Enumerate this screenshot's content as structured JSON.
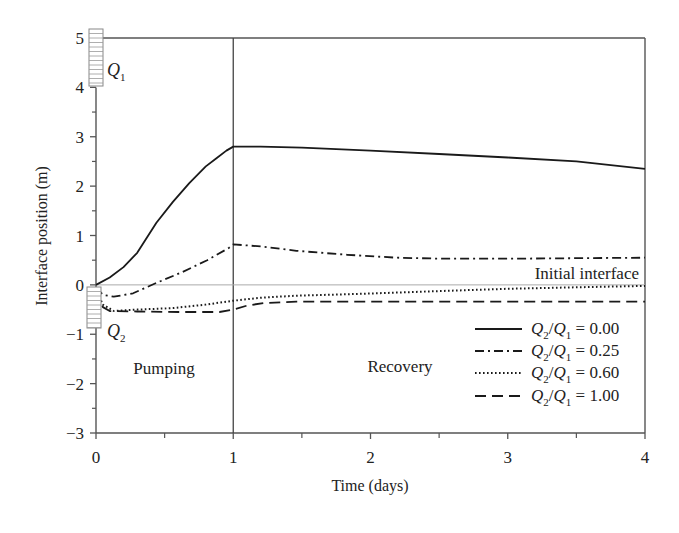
{
  "chart_data": {
    "type": "line",
    "title": "",
    "xlabel": "Time (days)",
    "ylabel": "Interface position (m)",
    "xlim": [
      0,
      4
    ],
    "ylim": [
      -3,
      5
    ],
    "xticks": [
      0,
      1,
      2,
      3,
      4
    ],
    "xticks_minor": [
      0.5,
      1.5,
      2.5,
      3.5
    ],
    "yticks": [
      -3,
      -2,
      -1,
      0,
      1,
      2,
      3,
      4,
      5
    ],
    "yticks_minor": [
      -2.5,
      -1.5,
      -0.5,
      0.5,
      1.5,
      2.5,
      3.5,
      4.5
    ],
    "grid": false,
    "legend_position": "lower right",
    "reference_lines": {
      "vertical_x": 1,
      "horizontal_y": 0,
      "horizontal_label": "Initial interface"
    },
    "annotations": {
      "pumping": "Pumping",
      "recovery": "Recovery",
      "q1_well": "Q",
      "q1_sub": "1",
      "q2_well": "Q",
      "q2_sub": "2"
    },
    "series": [
      {
        "name": "Q2/Q1 = 0.00",
        "ratio": "0.00",
        "style": "solid",
        "x": [
          0,
          0.1,
          0.2,
          0.3,
          0.44,
          0.56,
          0.68,
          0.8,
          0.88,
          0.95,
          1.0,
          1.2,
          1.5,
          2.0,
          2.5,
          3.0,
          3.5,
          4.0
        ],
        "y": [
          0,
          0.15,
          0.36,
          0.65,
          1.26,
          1.68,
          2.06,
          2.4,
          2.57,
          2.72,
          2.8,
          2.8,
          2.78,
          2.72,
          2.65,
          2.58,
          2.5,
          2.35
        ]
      },
      {
        "name": "Q2/Q1 = 0.25",
        "ratio": "0.25",
        "style": "dashdot",
        "x": [
          0,
          0.05,
          0.13,
          0.27,
          0.44,
          0.63,
          0.81,
          0.97,
          1.0,
          1.2,
          1.46,
          1.83,
          2.19,
          2.53,
          3.0,
          3.5,
          4.0
        ],
        "y": [
          -0.05,
          -0.2,
          -0.24,
          -0.17,
          0.04,
          0.26,
          0.5,
          0.75,
          0.82,
          0.78,
          0.69,
          0.61,
          0.55,
          0.53,
          0.53,
          0.54,
          0.55
        ]
      },
      {
        "name": "Q2/Q1 = 0.60",
        "ratio": "0.60",
        "style": "dotted",
        "x": [
          0,
          0.05,
          0.13,
          0.3,
          0.56,
          0.8,
          1.0,
          1.2,
          1.46,
          1.94,
          2.56,
          3.0,
          3.5,
          4.0
        ],
        "y": [
          -0.1,
          -0.4,
          -0.53,
          -0.5,
          -0.47,
          -0.4,
          -0.32,
          -0.26,
          -0.22,
          -0.18,
          -0.12,
          -0.08,
          -0.05,
          -0.02
        ]
      },
      {
        "name": "Q2/Q1 = 1.00",
        "ratio": "1.00",
        "style": "dashed",
        "x": [
          0,
          0.05,
          0.1,
          0.3,
          0.6,
          0.9,
          1.0,
          1.1,
          1.22,
          1.46,
          2.0,
          3.0,
          4.0
        ],
        "y": [
          -0.1,
          -0.45,
          -0.53,
          -0.54,
          -0.55,
          -0.55,
          -0.5,
          -0.42,
          -0.37,
          -0.34,
          -0.34,
          -0.34,
          -0.34
        ]
      }
    ]
  },
  "legend": {
    "prefix_q": "Q",
    "sub_2": "2",
    "sub_1": "1",
    "items": [
      {
        "value": " = 0.00"
      },
      {
        "value": " = 0.25"
      },
      {
        "value": " = 0.60"
      },
      {
        "value": " = 1.00"
      }
    ]
  },
  "axis_labels": {
    "x": [
      "0",
      "1",
      "2",
      "3",
      "4"
    ],
    "y": [
      "5",
      "4",
      "3",
      "2",
      "1",
      "0",
      "−1",
      "−2",
      "−3"
    ]
  }
}
